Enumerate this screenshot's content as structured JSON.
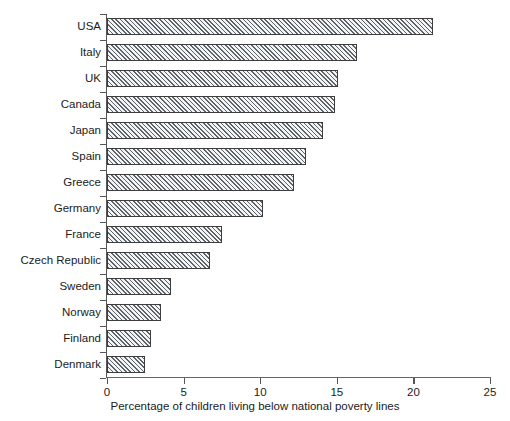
{
  "chart_data": {
    "type": "bar",
    "orientation": "horizontal",
    "title": "",
    "xlabel": "Percentage of children living below national poverty lines",
    "ylabel": "",
    "xlim": [
      0,
      25
    ],
    "xticks": [
      "0",
      "5",
      "10",
      "15",
      "20",
      "25"
    ],
    "grid": false,
    "legend": null,
    "categories": [
      "USA",
      "Italy",
      "UK",
      "Canada",
      "Japan",
      "Spain",
      "Greece",
      "Germany",
      "France",
      "Czech Republic",
      "Sweden",
      "Norway",
      "Finland",
      "Denmark"
    ],
    "values": [
      21.3,
      16.3,
      15.1,
      14.9,
      14.1,
      13.0,
      12.2,
      10.2,
      7.5,
      6.7,
      4.2,
      3.5,
      2.9,
      2.5
    ],
    "bar_fill": "diagonal-hatch",
    "bar_edge_color": "#3d3d3d",
    "bar_hatch_color": "#5d6368",
    "bar_face_color": "#f2f4f5",
    "axis_color": "#555555",
    "background_color": "#ffffff"
  }
}
